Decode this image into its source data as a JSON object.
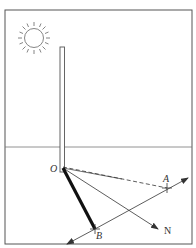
{
  "diagram": {
    "title": "",
    "colors": {
      "line": "#444444",
      "frame": "#555555",
      "bold": "#111111",
      "sun": "#666666"
    },
    "labels": {
      "origin": "O",
      "point_a": "A",
      "point_b": "B",
      "north": "N"
    },
    "elements": [
      {
        "name": "sun",
        "type": "circle-with-rays",
        "center": [
          34,
          38
        ],
        "radius": 10
      },
      {
        "name": "pole",
        "type": "vertical-bar",
        "from": [
          62,
          47
        ],
        "to": [
          62,
          172
        ]
      },
      {
        "name": "horizon",
        "type": "line"
      },
      {
        "name": "shadow-OB",
        "type": "thick-line",
        "from": "O",
        "to": "B"
      },
      {
        "name": "dashed-OA",
        "type": "dashed-line",
        "from": "O",
        "to": "A"
      },
      {
        "name": "line-ON",
        "type": "arrow",
        "from": "O",
        "to": "N"
      },
      {
        "name": "line-AB",
        "type": "double-arrow",
        "through": [
          "A",
          "B"
        ]
      }
    ]
  }
}
